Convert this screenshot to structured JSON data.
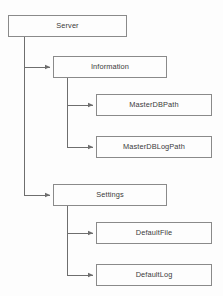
{
  "diagram": {
    "type": "tree-hierarchy",
    "background_color": "#fdfdfd",
    "box_border_color": "#8a8a8a",
    "box_fill_color": "#fdfdfd",
    "connector_color": "#6e6e6e",
    "text_color": "#3b3b3b",
    "nodes": [
      {
        "id": "server",
        "label": "Server",
        "level": 0,
        "x": 8,
        "y": 15,
        "w": 119,
        "h": 22
      },
      {
        "id": "information",
        "label": "Information",
        "level": 1,
        "x": 53,
        "y": 56,
        "w": 114,
        "h": 22
      },
      {
        "id": "masterdbpath",
        "label": "MasterDBPath",
        "level": 2,
        "x": 96,
        "y": 94,
        "w": 116,
        "h": 22
      },
      {
        "id": "masterdblogpath",
        "label": "MasterDBLogPath",
        "level": 2,
        "x": 96,
        "y": 136,
        "w": 116,
        "h": 22
      },
      {
        "id": "settings",
        "label": "Settings",
        "level": 1,
        "x": 53,
        "y": 184,
        "w": 114,
        "h": 22
      },
      {
        "id": "defaultfile",
        "label": "DefaultFile",
        "level": 2,
        "x": 96,
        "y": 222,
        "w": 116,
        "h": 22
      },
      {
        "id": "defaultlog",
        "label": "DefaultLog",
        "level": 2,
        "x": 96,
        "y": 264,
        "w": 116,
        "h": 22
      }
    ],
    "edges": [
      {
        "id": "server-information",
        "from": "server",
        "to": "information",
        "trunk_x": 24,
        "target_y": 67
      },
      {
        "id": "server-settings",
        "from": "server",
        "to": "settings",
        "trunk_x": 24,
        "target_y": 195
      },
      {
        "id": "information-masterdbpath",
        "from": "information",
        "to": "masterdbpath",
        "trunk_x": 67,
        "target_y": 105
      },
      {
        "id": "information-masterdblogpath",
        "from": "information",
        "to": "masterdblogpath",
        "trunk_x": 67,
        "target_y": 147
      },
      {
        "id": "settings-defaultfile",
        "from": "settings",
        "to": "defaultfile",
        "trunk_x": 67,
        "target_y": 233
      },
      {
        "id": "settings-defaultlog",
        "from": "settings",
        "to": "defaultlog",
        "trunk_x": 67,
        "target_y": 275
      }
    ]
  }
}
